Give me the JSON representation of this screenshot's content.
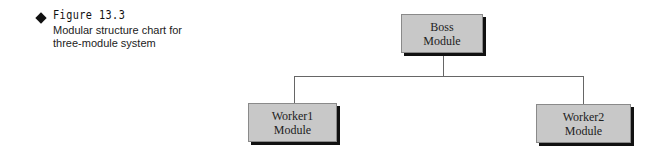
{
  "figure": {
    "number": "Figure 13.3",
    "title": "Modular structure chart for three-module system",
    "title_lines": [
      "Modular structure chart for",
      "three-module system"
    ]
  },
  "diagram": {
    "type": "hierarchy",
    "nodes": [
      {
        "id": "boss",
        "line1": "Boss",
        "line2": "Module",
        "level": 0
      },
      {
        "id": "worker1",
        "line1": "Worker1",
        "line2": "Module",
        "level": 1
      },
      {
        "id": "worker2",
        "line1": "Worker2",
        "line2": "Module",
        "level": 1
      }
    ],
    "edges": [
      {
        "from": "boss",
        "to": "worker1"
      },
      {
        "from": "boss",
        "to": "worker2"
      }
    ]
  }
}
